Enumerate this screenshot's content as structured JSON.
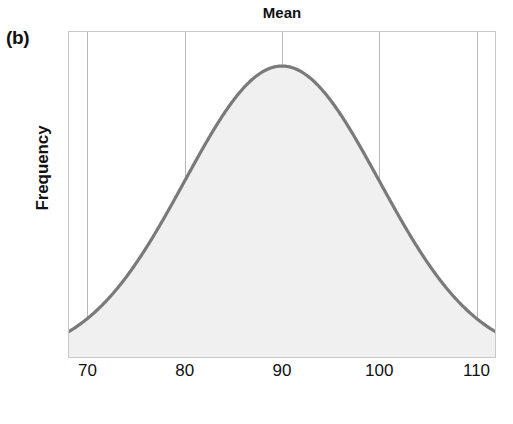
{
  "figure": {
    "panel_label": "(b)",
    "title": "Mean",
    "x_axis_title": "Golf scores",
    "y_axis_title": "Frequency"
  },
  "colors": {
    "curve_stroke": "#7a7a7a",
    "curve_fill": "#f0f0f0",
    "gridline": "#b8b8b8",
    "frame": "#c8c8c8",
    "text": "#111111",
    "background": "#ffffff"
  },
  "chart_data": {
    "type": "line",
    "title": "Mean",
    "xlabel": "Golf scores",
    "ylabel": "Frequency",
    "xlim": [
      68,
      112
    ],
    "ylim": [
      0,
      1.12
    ],
    "grid": true,
    "legend": null,
    "distribution": {
      "shape": "normal",
      "mean": 90,
      "std_dev": 10,
      "peak_x": 90,
      "symmetric": true
    },
    "annotations": [
      {
        "label": "Mean",
        "x": 90,
        "position": "top-center"
      }
    ],
    "xticks": [
      70,
      80,
      90,
      100,
      110
    ],
    "xtick_labels": [
      "70",
      "80",
      "90",
      "100",
      "110"
    ],
    "yticks": [],
    "ytick_labels": [],
    "x": [
      68,
      70,
      72,
      74,
      76,
      78,
      80,
      82,
      84,
      86,
      88,
      90,
      92,
      94,
      96,
      98,
      100,
      102,
      104,
      106,
      108,
      110,
      112
    ],
    "y": [
      0.017,
      0.044,
      0.096,
      0.186,
      0.316,
      0.486,
      0.667,
      0.835,
      0.946,
      0.996,
      1.0,
      1.0,
      1.0,
      0.996,
      0.946,
      0.835,
      0.667,
      0.486,
      0.316,
      0.186,
      0.096,
      0.044,
      0.017
    ],
    "series": [
      {
        "name": "Golf score distribution",
        "values": [
          0.017,
          0.044,
          0.096,
          0.186,
          0.316,
          0.486,
          0.667,
          0.835,
          0.946,
          0.996,
          1.0,
          1.0,
          1.0,
          0.996,
          0.946,
          0.835,
          0.667,
          0.486,
          0.316,
          0.186,
          0.096,
          0.044,
          0.017
        ],
        "filled": true
      }
    ]
  }
}
